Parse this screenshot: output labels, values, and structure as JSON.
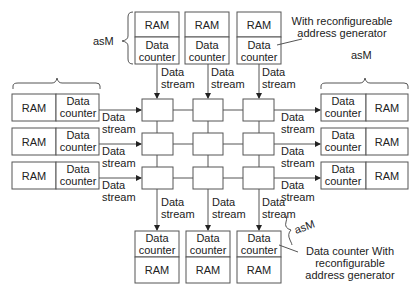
{
  "diagram": {
    "labels": {
      "ram": "RAM",
      "data": "Data",
      "counter": "counter",
      "stream": "stream",
      "asm": "asM"
    },
    "annotations": {
      "top_note_line1": "With reconfigureable",
      "top_note_line2": "address generator",
      "right_asm": "asM",
      "top_asm": "asM",
      "bottom_asm": "asM",
      "bottom_note_line1": "Data counter With",
      "bottom_note_line2": "reconfigurable",
      "bottom_note_line3": "address generator"
    },
    "modules": {
      "top": [
        {
          "top": "RAM",
          "bottom": "Data counter"
        },
        {
          "top": "RAM",
          "bottom": "Data counter"
        },
        {
          "top": "RAM",
          "bottom": "Data counter"
        }
      ],
      "left": [
        {
          "left": "RAM",
          "right": "Data counter"
        },
        {
          "left": "RAM",
          "right": "Data counter"
        },
        {
          "left": "RAM",
          "right": "Data counter"
        }
      ],
      "right": [
        {
          "left": "Data counter",
          "right": "RAM"
        },
        {
          "left": "Data counter",
          "right": "RAM"
        },
        {
          "left": "Data counter",
          "right": "RAM"
        }
      ],
      "bottom": [
        {
          "top": "Data counter",
          "bottom": "RAM"
        },
        {
          "top": "Data counter",
          "bottom": "RAM"
        },
        {
          "top": "Data counter",
          "bottom": "RAM"
        }
      ]
    },
    "grid": {
      "rows": 3,
      "cols": 3
    },
    "edge_label": "Data stream"
  }
}
